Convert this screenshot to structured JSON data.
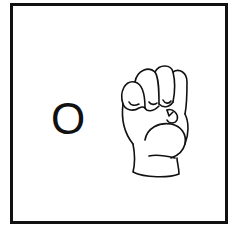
{
  "card": {
    "letter": "O",
    "sign_icon": "asl-fist-handshape-icon",
    "border_color": "#111111",
    "background_color": "#ffffff"
  }
}
